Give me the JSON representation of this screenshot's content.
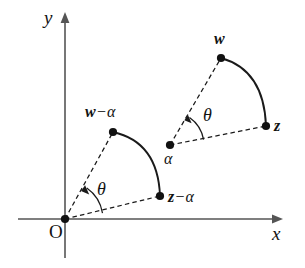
{
  "figure": {
    "background_color": "#ffffff",
    "ink_color": "#121212",
    "axis_color": "#555555",
    "width": 305,
    "height": 268
  },
  "axes": {
    "x_label": "x",
    "y_label": "y",
    "origin_label": "O",
    "origin_point": {
      "x": 65,
      "y": 219
    },
    "x_axis": {
      "start_x": 18,
      "end_x": 283,
      "y": 219,
      "arrow": "right"
    },
    "y_axis": {
      "x": 65,
      "start_y": 258,
      "end_y": 12,
      "arrow": "up"
    }
  },
  "angles": [
    {
      "name": "theta-at-origin",
      "label": "θ",
      "vertex": {
        "x": 65,
        "y": 219
      },
      "radius": 38,
      "start_deg": 9,
      "end_deg": 55,
      "label_pos": {
        "x": 97,
        "y": 180
      }
    },
    {
      "name": "theta-at-alpha",
      "label": "θ",
      "vertex": {
        "x": 170,
        "y": 145
      },
      "radius": 34,
      "start_deg": 9,
      "end_deg": 55,
      "label_pos": {
        "x": 203,
        "y": 106
      }
    }
  ],
  "points": [
    {
      "name": "w-minus-alpha",
      "label_parts": {
        "base": "w",
        "operator": "−",
        "greek": "α"
      },
      "label_text": "w − α",
      "dot": {
        "x": 113,
        "y": 132
      },
      "label_pos": {
        "x": 85,
        "y": 105
      }
    },
    {
      "name": "z-minus-alpha",
      "label_parts": {
        "base": "z",
        "operator": "−",
        "greek": "α"
      },
      "label_text": "z − α",
      "dot": {
        "x": 160,
        "y": 196
      },
      "label_pos": {
        "x": 168,
        "y": 190
      }
    },
    {
      "name": "w",
      "label_parts": {
        "base": "w",
        "operator": "",
        "greek": ""
      },
      "label_text": "w",
      "dot": {
        "x": 221,
        "y": 58
      },
      "label_pos": {
        "x": 215,
        "y": 32
      }
    },
    {
      "name": "z",
      "label_parts": {
        "base": "z",
        "operator": "",
        "greek": ""
      },
      "label_text": "z",
      "dot": {
        "x": 266,
        "y": 126
      },
      "label_pos": {
        "x": 274,
        "y": 119
      }
    },
    {
      "name": "alpha",
      "label_parts": {
        "base": "α",
        "operator": "",
        "greek": ""
      },
      "label_text": "α",
      "dot": {
        "x": 170,
        "y": 145
      },
      "label_pos": {
        "x": 165,
        "y": 152
      }
    }
  ],
  "dashed_rays": [
    {
      "name": "origin-to-w-minus-alpha",
      "x1": 65,
      "y1": 219,
      "x2": 113,
      "y2": 132
    },
    {
      "name": "origin-to-z-minus-alpha",
      "x1": 65,
      "y1": 219,
      "x2": 160,
      "y2": 196
    },
    {
      "name": "alpha-to-w",
      "x1": 170,
      "y1": 145,
      "x2": 221,
      "y2": 58
    },
    {
      "name": "alpha-to-z",
      "x1": 170,
      "y1": 145,
      "x2": 266,
      "y2": 126
    }
  ],
  "arcs": [
    {
      "name": "arc-w-minus-alpha-to-z-minus-alpha",
      "from": {
        "x": 113,
        "y": 132
      },
      "to": {
        "x": 160,
        "y": 196
      },
      "control": {
        "x": 158,
        "y": 142
      }
    },
    {
      "name": "arc-w-to-z",
      "from": {
        "x": 221,
        "y": 58
      },
      "to": {
        "x": 266,
        "y": 126
      },
      "control": {
        "x": 264,
        "y": 70
      }
    }
  ]
}
